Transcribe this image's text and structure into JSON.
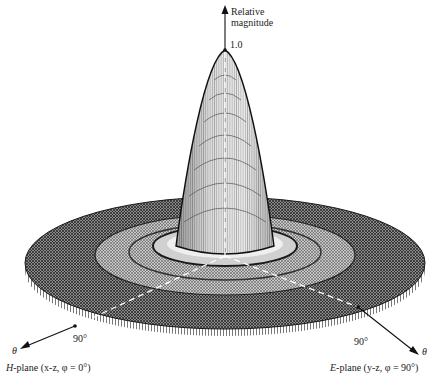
{
  "diagram": {
    "type": "3D radiation pattern (relative magnitude surface plot)",
    "vertical_axis": {
      "label_line1": "Relative",
      "label_line2": "magnitude",
      "peak_value": "1.0"
    },
    "left_axis": {
      "symbol": "θ",
      "tick": "90°",
      "plane_label_prefix": "H",
      "plane_label_rest": "-plane (x-z, φ = 0°)"
    },
    "right_axis": {
      "symbol": "θ",
      "tick": "90°",
      "plane_label_prefix": "E",
      "plane_label_rest": "-plane (y-z, φ = 90°)"
    },
    "colors": {
      "ink": "#1a1a1a",
      "mesh_dark": "#2b2b2b",
      "mesh_mid": "#6e6e6e",
      "surface_light": "#d8d8d8",
      "background": "#ffffff"
    }
  }
}
